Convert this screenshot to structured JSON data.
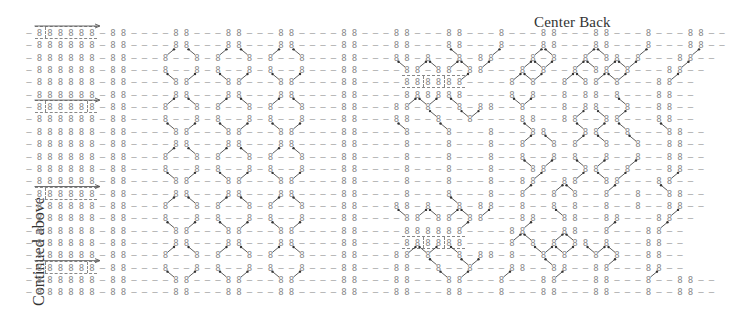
{
  "labels": {
    "center_back": "Center Back",
    "continued": "Continued above"
  },
  "grid": {
    "origin_x": 29,
    "origin_y": 29,
    "col_pitch": 10.5,
    "row_pitch": 12.35,
    "ink_color": "#8a8a8a",
    "arrow_color": "#333333",
    "rows": [
      "-888888-88----88---88---88----88---88---88---8---88---88---8---88--",
      "-888888-88----88---88---88----88---88---88---8---88---88---8---88--",
      "-888888-88---8--8-8--8-8--8---88---88-8--8-88---8-8--8-88-8---88--",
      "-888888-88---8--8-8--8-8--8---88----88-88-88---8-8--8-88-8---88--",
      "-888888-88----88---88---88----88----888888----8-8--8-88-8---88--",
      "-888888-88----88---88---88----88----888888----8-8--8-88-8---88--",
      "-888888-88---8--8-8--8-8--8---88---88-8--8-88--8---8-88--8--88--",
      "-888888-88---8--8-8--8-8--8---88---88--8--8----88--88--88---88--",
      "-888888-88----88---88---88----88----8---8---8---88---88--8---88--",
      "-888888-88----88---88---88----88----8---8---8--8--8-8--8--8--88--",
      "-888888-88---8--8-8--8-8--8---88----8---8---8--8--8-8--8--8--88--",
      "-888888-88---8--8-8--8-8--8---88----8---8---8---88---88--8---88--",
      "-888888-88----88---88---88----88----8---8---8--88--88--88---88--",
      "-888888-88----88---88---88----88----8---8---8--8--8-8--8--8--88--",
      "-888888-88---8--8-8--8-8--8---88---88-8--8-88--8--8-8--8--8--88--",
      "-888888-88---8--8-8--8-8--8---88----88-88-88---88--88--88---88--",
      "-888888-88----88---88---88----88----888888----88---88--8---88--",
      "-888888-88----88---88---88----88----888888----8-8-8-88-8---88--",
      "-888888-88---8--8-8--8-8--8---88---88-8--8-88-8--8-8--8-8--88--",
      "-888888-88---8--8-8--8-8--8---88---88--8--8---88--88--88---88--",
      "-888888-88----88---88---88----88---88---88---8---88---88---8--88--",
      "-888888-88----88---88---88----88---88---88---8---88---88---8--88--"
    ],
    "frames": [
      {
        "row": 0,
        "col_start": 1,
        "col_end": 6,
        "seps": [
          2
        ],
        "arrow": true
      },
      {
        "row": 6,
        "col_start": 1,
        "col_end": 6,
        "seps": [
          2,
          6
        ],
        "arrow": true
      },
      {
        "row": 13,
        "col_start": 1,
        "col_end": 6,
        "seps": [
          2
        ],
        "arrow": true
      },
      {
        "row": 19,
        "col_start": 1,
        "col_end": 6,
        "seps": [
          2,
          6
        ],
        "arrow": true
      },
      {
        "row": 4,
        "col_start": 36,
        "col_end": 41,
        "seps": [
          38,
          40
        ],
        "arrow": false
      },
      {
        "row": 17,
        "col_start": 36,
        "col_end": 41,
        "seps": [
          38,
          40
        ],
        "arrow": false
      }
    ],
    "cable_arrows": [
      {
        "from": [
          13,
          2
        ],
        "to": [
          14,
          0.3
        ],
        "dir": "up-right"
      },
      {
        "from": [
          16,
          2
        ],
        "to": [
          15,
          0.3
        ],
        "dir": "up-left"
      },
      {
        "from": [
          18,
          2
        ],
        "to": [
          19,
          0.3
        ],
        "dir": "up-right"
      },
      {
        "from": [
          21,
          2
        ],
        "to": [
          20,
          0.3
        ],
        "dir": "up-left"
      },
      {
        "from": [
          23,
          2
        ],
        "to": [
          24,
          0.3
        ],
        "dir": "up-right"
      },
      {
        "from": [
          26,
          2
        ],
        "to": [
          25,
          0.3
        ],
        "dir": "up-left"
      }
    ]
  }
}
